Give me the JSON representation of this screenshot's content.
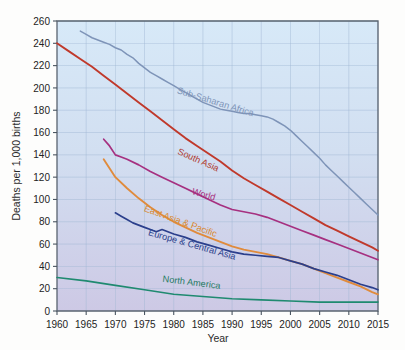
{
  "chart_data": {
    "type": "line",
    "title": "",
    "xlabel": "Year",
    "ylabel": "Deaths per 1,000 births",
    "xlim": [
      1960,
      2015
    ],
    "ylim": [
      0,
      260
    ],
    "grid": true,
    "legend_position": "inline-labels",
    "xticks": [
      1960,
      1965,
      1970,
      1975,
      1980,
      1985,
      1990,
      1995,
      2000,
      2005,
      2010,
      2015
    ],
    "yticks": [
      0,
      20,
      40,
      60,
      80,
      100,
      120,
      140,
      160,
      180,
      200,
      220,
      240,
      260
    ],
    "series": [
      {
        "name": "Sub-Saharan Africa",
        "color": "#7e94b8",
        "label_color": "#7e94b8",
        "x": [
          1964,
          1965,
          1966,
          1967,
          1968,
          1969,
          1970,
          1971,
          1972,
          1973,
          1974,
          1975,
          1976,
          1977,
          1978,
          1979,
          1980,
          1981,
          1982,
          1983,
          1984,
          1985,
          1986,
          1987,
          1988,
          1989,
          1990,
          1991,
          1992,
          1993,
          1994,
          1995,
          1996,
          1997,
          1998,
          1999,
          2000,
          2001,
          2002,
          2003,
          2004,
          2005,
          2006,
          2007,
          2008,
          2009,
          2010,
          2011,
          2012,
          2013,
          2014,
          2015
        ],
        "y": [
          251,
          248,
          245,
          243,
          241,
          239,
          236,
          234,
          230,
          227,
          222,
          218,
          214,
          211,
          208,
          205,
          202,
          199,
          196,
          193,
          190,
          187,
          185,
          183,
          181,
          180,
          179,
          178,
          177,
          177,
          176,
          175,
          174,
          172,
          169,
          166,
          162,
          157,
          152,
          147,
          142,
          137,
          131,
          126,
          121,
          116,
          111,
          106,
          101,
          96,
          91,
          86
        ]
      },
      {
        "name": "South Asia",
        "color": "#c0392b",
        "label_color": "#b03a2e",
        "x": [
          1960,
          1962,
          1964,
          1966,
          1968,
          1970,
          1972,
          1974,
          1976,
          1978,
          1980,
          1982,
          1984,
          1986,
          1988,
          1990,
          1992,
          1994,
          1996,
          1998,
          2000,
          2002,
          2004,
          2006,
          2008,
          2010,
          2012,
          2014,
          2015
        ],
        "y": [
          240,
          233,
          226,
          219,
          211,
          203,
          195,
          187,
          179,
          171,
          163,
          155,
          148,
          141,
          134,
          126,
          119,
          113,
          107,
          101,
          95,
          89,
          83,
          77,
          72,
          67,
          62,
          57,
          54
        ]
      },
      {
        "name": "World",
        "color": "#a63080",
        "label_color": "#a63080",
        "x": [
          1968,
          1969,
          1970,
          1971,
          1972,
          1974,
          1976,
          1978,
          1980,
          1982,
          1984,
          1986,
          1988,
          1990,
          1992,
          1994,
          1996,
          1998,
          2000,
          2002,
          2004,
          2006,
          2008,
          2010,
          2012,
          2014,
          2015
        ],
        "y": [
          154,
          148,
          140,
          138,
          136,
          131,
          125,
          120,
          115,
          110,
          105,
          100,
          95,
          91,
          89,
          87,
          84,
          80,
          76,
          72,
          68,
          64,
          60,
          56,
          52,
          48,
          46
        ]
      },
      {
        "name": "East Asia & Pacific",
        "color": "#e08b3c",
        "label_color": "#d9892f",
        "x": [
          1968,
          1969,
          1970,
          1972,
          1974,
          1976,
          1978,
          1980,
          1982,
          1984,
          1986,
          1988,
          1990,
          1992,
          1994,
          1996,
          1998,
          2000,
          2002,
          2004,
          2006,
          2008,
          2010,
          2012,
          2014,
          2015
        ],
        "y": [
          136,
          128,
          120,
          110,
          101,
          93,
          86,
          80,
          75,
          70,
          66,
          62,
          58,
          55,
          53,
          51,
          48,
          45,
          42,
          38,
          34,
          30,
          26,
          22,
          17,
          15
        ]
      },
      {
        "name": "Europe & Central Asia",
        "color": "#2b3f8c",
        "label_color": "#2b3f8c",
        "x": [
          1970,
          1971,
          1972,
          1973,
          1974,
          1975,
          1976,
          1977,
          1978,
          1979,
          1980,
          1982,
          1984,
          1986,
          1988,
          1990,
          1992,
          1994,
          1996,
          1998,
          2000,
          2002,
          2004,
          2006,
          2008,
          2010,
          2012,
          2014,
          2015
        ],
        "y": [
          88,
          85,
          82,
          79,
          77,
          75,
          73,
          71,
          73,
          71,
          69,
          66,
          62,
          59,
          56,
          53,
          51,
          50,
          49,
          48,
          45,
          42,
          38,
          35,
          32,
          28,
          24,
          21,
          19
        ]
      },
      {
        "name": "North America",
        "color": "#1f8a70",
        "label_color": "#1f7a62",
        "x": [
          1960,
          1965,
          1970,
          1975,
          1980,
          1985,
          1990,
          1995,
          2000,
          2005,
          2010,
          2015
        ],
        "y": [
          30,
          27,
          23,
          19,
          15,
          13,
          11,
          10,
          9,
          8,
          8,
          8
        ]
      }
    ],
    "annotations": [
      {
        "text": "Sub-Saharan Africa",
        "x": 1987,
        "y": 185,
        "rotation": 17,
        "series": "Sub-Saharan Africa"
      },
      {
        "text": "South Asia",
        "x": 1984,
        "y": 133,
        "rotation": 24,
        "series": "South Asia"
      },
      {
        "text": "World",
        "x": 1985,
        "y": 102,
        "rotation": 16,
        "series": "World"
      },
      {
        "text": "East Asia & Pacific",
        "x": 1981,
        "y": 78,
        "rotation": 20,
        "series": "East Asia & Pacific"
      },
      {
        "text": "Europe & Central Asia",
        "x": 1983,
        "y": 57,
        "rotation": 16,
        "series": "Europe & Central Asia"
      },
      {
        "text": "North America",
        "x": 1983,
        "y": 23,
        "rotation": 7,
        "series": "North America"
      }
    ]
  },
  "colors": {
    "plot_bg_top": "#d5e8f7",
    "plot_bg_bottom": "#cfcbe6",
    "grid": "#9fb7d4",
    "axis": "#5a6470",
    "page_bg": "#fdfdfc"
  }
}
